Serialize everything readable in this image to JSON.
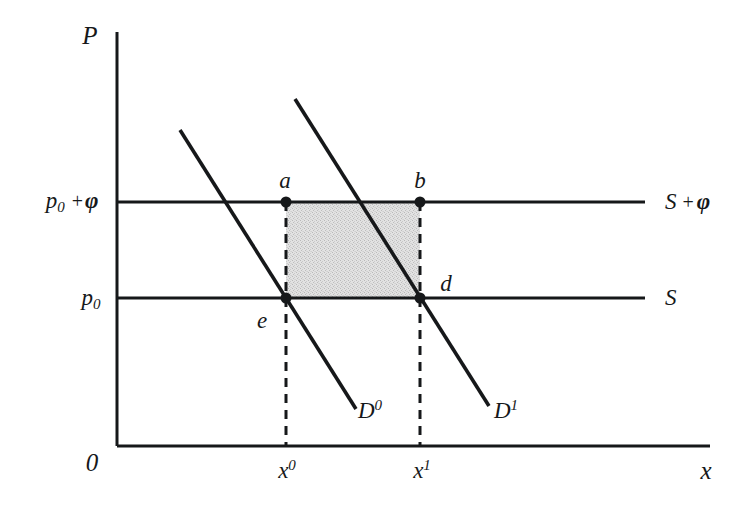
{
  "figure": {
    "type": "economics-supply-demand-diagram",
    "axes": {
      "y_label": "P",
      "x_label": "x",
      "origin_label": "0"
    },
    "price_ticks": [
      {
        "id": "p0-plus-phi",
        "base": "p",
        "subscript": "0",
        "operator": "+",
        "term": "φ",
        "y_px": 202
      },
      {
        "id": "p0",
        "base": "p",
        "subscript": "0",
        "operator": "",
        "term": "",
        "y_px": 298
      }
    ],
    "quantity_ticks": [
      {
        "id": "x0",
        "base": "x",
        "superscript": "0",
        "x_px": 285
      },
      {
        "id": "x1",
        "base": "x",
        "superscript": "1",
        "x_px": 420
      }
    ],
    "supply_lines": [
      {
        "id": "supply-with-tax",
        "base": "S",
        "operator": "+",
        "term": "φ",
        "y_px": 202
      },
      {
        "id": "supply",
        "base": "S",
        "operator": "",
        "term": "",
        "y_px": 298
      }
    ],
    "demand_curves": [
      {
        "id": "demand-0",
        "base": "D",
        "superscript": "0",
        "label_x": 370,
        "label_y": 410
      },
      {
        "id": "demand-1",
        "base": "D",
        "superscript": "1",
        "label_x": 506,
        "label_y": 410
      }
    ],
    "points": [
      {
        "id": "a",
        "label": "a",
        "x_px": 285,
        "y_px": 202,
        "label_x": 285,
        "label_y": 180
      },
      {
        "id": "b",
        "label": "b",
        "x_px": 420,
        "y_px": 202,
        "label_x": 420,
        "label_y": 180
      },
      {
        "id": "d",
        "label": "d",
        "x_px": 420,
        "y_px": 298,
        "label_x": 446,
        "label_y": 283
      },
      {
        "id": "e",
        "label": "e",
        "x_px": 285,
        "y_px": 298,
        "label_x": 262,
        "label_y": 320
      }
    ],
    "shaded_region": {
      "name": "tax-revenue-rectangle",
      "corners": "a-b-d-e",
      "left": 285,
      "right": 420,
      "top": 202,
      "bottom": 298,
      "fill": "#dcdcdc"
    },
    "colors": {
      "ink": "#16181a",
      "background": "#ffffff",
      "shade": "#dcdcdc"
    }
  }
}
